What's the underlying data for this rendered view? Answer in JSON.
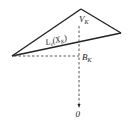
{
  "diagram": {
    "labels": {
      "vertex_top": "V",
      "vertex_top_sub": "K",
      "line_label_main": "L",
      "line_label_sub": "e",
      "line_label_arg_open": "(X",
      "line_label_arg_sub": "K",
      "line_label_arg_close": ")",
      "foot_point": "B",
      "foot_point_sub": "K",
      "origin": "0"
    },
    "colors": {
      "stroke": "#222222",
      "background": "#ffffff"
    }
  }
}
